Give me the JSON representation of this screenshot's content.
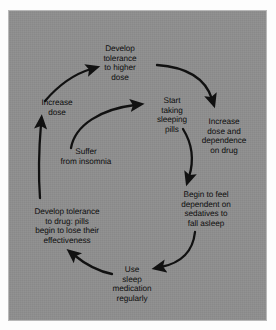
{
  "figure": {
    "type": "cycle-diagram",
    "title": "",
    "panel_color": "#8e8e8e",
    "text_color": "#0d0d0d",
    "arrow_color": "#111111",
    "background_color": "#ffffff"
  },
  "nodes": [
    {
      "id": "develop-tolerance-higher",
      "text": "Develop tolerance to higher dose",
      "lines": [
        "Develop",
        "tolerance",
        "to higher",
        "dose"
      ]
    },
    {
      "id": "start-taking",
      "text": "Start taking sleeping pills",
      "lines": [
        "Start",
        "taking",
        "sleeping",
        "pills"
      ]
    },
    {
      "id": "increase-dose-dependence",
      "text": "Increase dose and dependence on drug",
      "lines": [
        "Increase",
        "dose and",
        "dependence",
        "on drug"
      ]
    },
    {
      "id": "begin-to-feel",
      "text": "Begin to feel dependent on sedatives to fall asleep",
      "lines": [
        "Begin to feel",
        "dependent on",
        "sedatives to",
        "fall asleep"
      ]
    },
    {
      "id": "use-sleep",
      "text": "Use sleep medication regularly",
      "lines": [
        "Use",
        "sleep",
        "medication",
        "regularly"
      ]
    },
    {
      "id": "develop-tolerance-drug",
      "text": "Develop tolerance to drug: pills begin to lose their effectiveness",
      "lines": [
        "Develop tolerance",
        "to drug: pills",
        "begin to lose their",
        "effectiveness"
      ]
    },
    {
      "id": "increase-dose",
      "text": "Increase dose",
      "lines": [
        "Increase",
        "dose"
      ]
    },
    {
      "id": "suffer-insomnia",
      "text": "Suffer from insomnia",
      "lines": [
        "Suffer",
        "from insomnia"
      ]
    }
  ],
  "arrows": [
    {
      "id": "start-to-increase-dependence",
      "from": "start-taking",
      "to": "increase-dose-dependence"
    },
    {
      "id": "start-to-begin-to-feel",
      "from": "start-taking",
      "to": "begin-to-feel"
    },
    {
      "id": "begin-to-feel-to-use-sleep",
      "from": "begin-to-feel",
      "to": "use-sleep"
    },
    {
      "id": "use-sleep-to-develop-tolerance-drug",
      "from": "use-sleep",
      "to": "develop-tolerance-drug"
    },
    {
      "id": "develop-tolerance-drug-to-increase-dose",
      "from": "develop-tolerance-drug",
      "to": "increase-dose"
    },
    {
      "id": "increase-dose-to-develop-tolerance-higher",
      "from": "increase-dose",
      "to": "develop-tolerance-higher"
    },
    {
      "id": "suffer-insomnia-to-start-taking",
      "from": "suffer-insomnia",
      "to": "start-taking"
    }
  ]
}
